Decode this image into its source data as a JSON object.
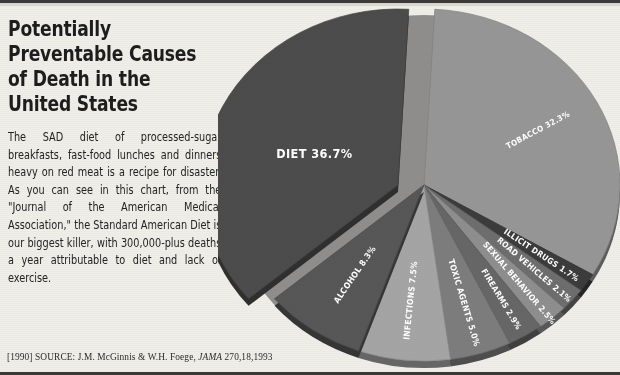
{
  "article": {
    "headline": "Potentially Preventable Causes of Death in the United States",
    "body": "The SAD diet of processed-sugar breakfasts, fast-food lunches and dinners heavy on red meat is a recipe for disaster. As you can see in this chart, from the \"Journal of the American Medical Association,\" the Standard American Diet is our biggest killer, with 300,000-plus deaths a year attributable to diet and lack of exercise.",
    "source_prefix": "[1990] SOURCE: J.M. McGinnis & W.H. Foege, ",
    "source_journal": "JAMA",
    "source_citation": " 270,18,1993"
  },
  "chart_data": {
    "type": "pie",
    "title": "Potentially Preventable Causes of Death in the United States",
    "unit": "percent",
    "exploded_slice": "DIET",
    "categories": [
      "DIET",
      "TOBACCO",
      "ILLICIT DRUGS",
      "ROAD VEHICLES",
      "SEXUAL BEHAVIOR",
      "FIREARMS",
      "TOXIC AGENTS",
      "INFECTIONS",
      "ALCOHOL"
    ],
    "values": [
      36.7,
      32.3,
      1.7,
      2.1,
      2.5,
      2.9,
      5.0,
      7.5,
      8.3
    ],
    "labels": [
      "DIET 36.7%",
      "TOBACCO 32.3%",
      "ILLICIT DRUGS 1.7%",
      "ROAD VEHICLES 2.1%",
      "SEXUAL BEHAVIOR 2.5%",
      "FIREARMS 2.9%",
      "TOXIC AGENTS 5.0%",
      "INFECTIONS 7.5%",
      "ALCOHOL 8.3%"
    ],
    "colors": [
      "#4c4c4c",
      "#969696",
      "#3c3c3c",
      "#6e6e6e",
      "#8e8e8e",
      "#676767",
      "#7d7d7d",
      "#a5a5a5",
      "#575757"
    ],
    "legend": "none",
    "grid": false
  }
}
